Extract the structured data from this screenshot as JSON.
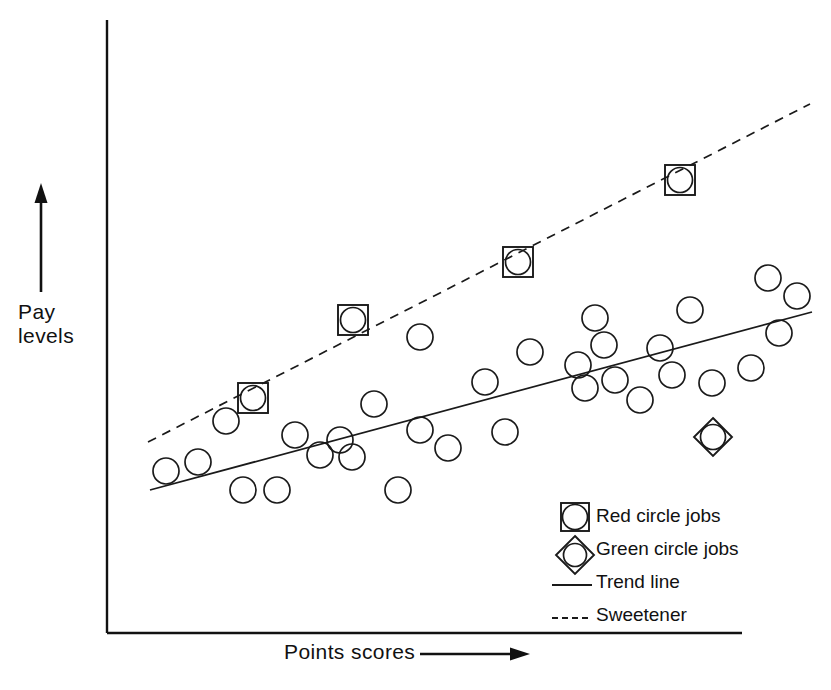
{
  "chart_data": {
    "type": "scatter",
    "title": "",
    "xlabel": "Points scores",
    "ylabel": "Pay levels",
    "xlim": [
      0,
      100
    ],
    "ylim": [
      0,
      100
    ],
    "grid": false,
    "axes_style": "arrowed-open-axes-no-ticks",
    "legend_position": "bottom-right-inside",
    "series": [
      {
        "name": "Ordinary jobs",
        "marker": "circle",
        "points": [
          [
            166,
            471
          ],
          [
            198,
            462
          ],
          [
            226,
            421
          ],
          [
            243,
            490
          ],
          [
            277,
            490
          ],
          [
            295,
            435
          ],
          [
            320,
            455
          ],
          [
            340,
            440
          ],
          [
            352,
            457
          ],
          [
            374,
            404
          ],
          [
            398,
            490
          ],
          [
            420,
            337
          ],
          [
            420,
            430
          ],
          [
            448,
            448
          ],
          [
            485,
            382
          ],
          [
            505,
            432
          ],
          [
            530,
            352
          ],
          [
            578,
            365
          ],
          [
            585,
            388
          ],
          [
            595,
            318
          ],
          [
            604,
            345
          ],
          [
            615,
            380
          ],
          [
            640,
            400
          ],
          [
            660,
            348
          ],
          [
            672,
            375
          ],
          [
            690,
            310
          ],
          [
            712,
            383
          ],
          [
            751,
            368
          ],
          [
            768,
            278
          ],
          [
            779,
            333
          ],
          [
            797,
            296
          ]
        ]
      },
      {
        "name": "Red circle jobs",
        "marker": "circle-in-square",
        "points": [
          [
            253,
            398
          ],
          [
            353,
            320
          ],
          [
            518,
            262
          ],
          [
            680,
            180
          ]
        ]
      },
      {
        "name": "Green circle jobs",
        "marker": "circle-in-diamond",
        "points": [
          [
            713,
            437
          ]
        ]
      }
    ],
    "lines": [
      {
        "name": "Trend line",
        "style": "solid",
        "from": [
          150,
          490
        ],
        "to": [
          812,
          312
        ]
      },
      {
        "name": "Sweetener",
        "style": "dashed",
        "from": [
          148,
          442
        ],
        "to": [
          810,
          104
        ]
      }
    ],
    "legend_entries": [
      {
        "label": "Red circle jobs",
        "marker": "circle-in-square"
      },
      {
        "label": "Green circle jobs",
        "marker": "circle-in-diamond"
      },
      {
        "label": "Trend line",
        "marker": "solid-line"
      },
      {
        "label": "Sweetener",
        "marker": "dashed-line"
      }
    ]
  },
  "colors": {
    "ink": "#111111",
    "background": "#ffffff"
  }
}
